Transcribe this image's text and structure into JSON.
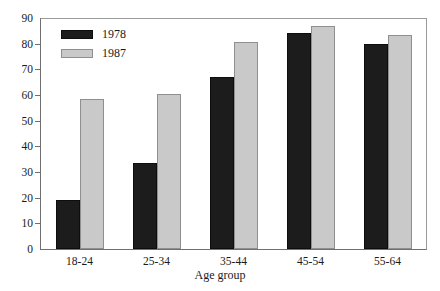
{
  "chart_data": {
    "type": "bar",
    "title": "",
    "subtitle": "",
    "xlabel": "Age group",
    "ylabel": "",
    "categories": [
      "18-24",
      "25-34",
      "35-44",
      "45-54",
      "55-64"
    ],
    "series": [
      {
        "name": "1978",
        "color": "#1c1c1c",
        "values": [
          19,
          33.5,
          67,
          84,
          80
        ]
      },
      {
        "name": "1987",
        "color": "#c9c9c9",
        "values": [
          58.5,
          60.5,
          80.5,
          87,
          83.5
        ]
      }
    ],
    "ylim": [
      0,
      90
    ],
    "ytick_labels": [
      "0",
      "10",
      "20",
      "30",
      "40",
      "50",
      "60",
      "70",
      "80",
      "90"
    ],
    "ytick_values": [
      0,
      10,
      20,
      30,
      40,
      50,
      60,
      70,
      80,
      90
    ],
    "grid": false,
    "legend_position": "upper-left",
    "frame": true,
    "background_color": "#ffffff",
    "axis_color": "#6f6f6f"
  },
  "legend": {
    "entries": [
      {
        "label": "1978"
      },
      {
        "label": "1987"
      }
    ]
  },
  "axes": {
    "x_title": "Age group"
  }
}
